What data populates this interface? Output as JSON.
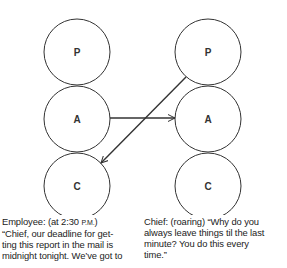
{
  "diagram": {
    "left_column": {
      "states": [
        {
          "label": "P",
          "cx": 77,
          "cy": 52
        },
        {
          "label": "A",
          "cx": 77,
          "cy": 119
        },
        {
          "label": "C",
          "cx": 77,
          "cy": 186
        }
      ]
    },
    "right_column": {
      "states": [
        {
          "label": "P",
          "cx": 208,
          "cy": 52
        },
        {
          "label": "A",
          "cx": 208,
          "cy": 119
        },
        {
          "label": "C",
          "cx": 208,
          "cy": 186
        }
      ]
    },
    "radius": 33,
    "arrows": [
      {
        "from": "left A",
        "to": "right A"
      },
      {
        "from": "right P",
        "to": "left C"
      }
    ],
    "stroke_color": "#333333"
  },
  "captions": {
    "left": {
      "speaker": "Employee: (at 2:30 ",
      "time_suffix": "P.M.",
      "close": ")",
      "lines": [
        "“Chief, our deadline for get-",
        "ting this report in the mail is",
        "midnight tonight. We’ve got to"
      ]
    },
    "right": {
      "lines": [
        "Chief: (roaring)  “Why do you",
        "always leave things til the last",
        "minute? You do this every",
        "time.”"
      ]
    }
  }
}
